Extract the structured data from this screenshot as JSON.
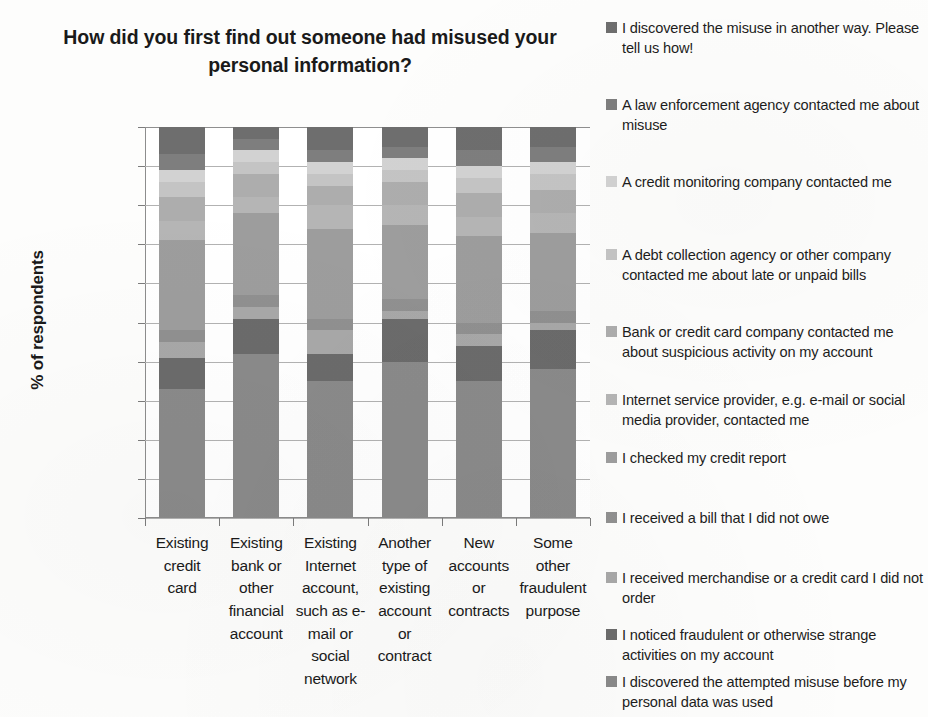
{
  "chart_data": {
    "type": "bar",
    "stacked": true,
    "title": "How did you first find out someone had misused your personal information?",
    "xlabel": "",
    "ylabel": "% of respondents",
    "ylim": [
      0,
      100
    ],
    "ytick_labels": [
      "0%",
      "10%",
      "20%",
      "30%",
      "40%",
      "50%",
      "60%",
      "70%",
      "80%",
      "90%",
      "100%"
    ],
    "ytick_values": [
      0,
      10,
      20,
      30,
      40,
      50,
      60,
      70,
      80,
      90,
      100
    ],
    "grid": true,
    "legend_position": "right",
    "categories": [
      "Existing credit card",
      "Existing bank or other financial account",
      "Existing Internet account, such as e-mail or social network",
      "Another type of existing account or contract",
      "New accounts or contracts",
      "Some other fraudulent purpose"
    ],
    "series": [
      {
        "name": "I discovered the attempted misuse before my personal data was used",
        "color": "#8a8a8a",
        "values": [
          33,
          42,
          35,
          40,
          35,
          38
        ]
      },
      {
        "name": "I noticed fraudulent or otherwise strange activities on my account",
        "color": "#6b6b6b",
        "values": [
          8,
          9,
          7,
          11,
          9,
          10
        ]
      },
      {
        "name": "I received merchandise or a credit card I did not order",
        "color": "#a8a8a8",
        "values": [
          4,
          3,
          6,
          2,
          3,
          2
        ]
      },
      {
        "name": "I received a bill that I did not owe",
        "color": "#909090",
        "values": [
          3,
          3,
          3,
          3,
          3,
          3
        ]
      },
      {
        "name": "I checked my credit report",
        "color": "#9d9d9d",
        "values": [
          23,
          21,
          23,
          19,
          22,
          20
        ]
      },
      {
        "name": "Internet service provider, e.g. e-mail or social media provider, contacted me",
        "color": "#b5b5b5",
        "values": [
          5,
          4,
          6,
          5,
          5,
          5
        ]
      },
      {
        "name": "Bank or credit card company contacted me about suspicious activity on my account",
        "color": "#adadad",
        "values": [
          6,
          6,
          5,
          6,
          6,
          6
        ]
      },
      {
        "name": "A debt collection agency or other company contacted me about late or unpaid bills",
        "color": "#c4c4c4",
        "values": [
          4,
          3,
          3,
          3,
          4,
          4
        ]
      },
      {
        "name": "A credit monitoring company contacted me",
        "color": "#d2d2d2",
        "values": [
          3,
          3,
          3,
          3,
          3,
          3
        ]
      },
      {
        "name": "A law enforcement agency contacted me about misuse",
        "color": "#7e7e7e",
        "values": [
          4,
          3,
          3,
          3,
          4,
          4
        ]
      },
      {
        "name": "I discovered the misuse in another way. Please tell us how!",
        "color": "#6e6e6e",
        "values": [
          7,
          3,
          6,
          5,
          6,
          5
        ]
      }
    ]
  },
  "chart": {
    "title": "How did you first find out someone had misused your personal information?",
    "y_axis_title": "% of respondents",
    "y_ticks": [
      "100%",
      "90%",
      "80%",
      "70%",
      "60%",
      "50%",
      "40%",
      "30%",
      "20%",
      "10%",
      "0%"
    ],
    "categories": [
      {
        "lines": [
          "Existing",
          "credit",
          "card"
        ]
      },
      {
        "lines": [
          "Existing",
          "bank or",
          "other",
          "financial",
          "account"
        ]
      },
      {
        "lines": [
          "Existing",
          "Internet",
          "account,",
          "such as e-",
          "mail or",
          "social",
          "network"
        ]
      },
      {
        "lines": [
          "Another",
          "type of",
          "existing",
          "account",
          "or",
          "contract"
        ]
      },
      {
        "lines": [
          "New",
          "accounts",
          "or",
          "contracts"
        ]
      },
      {
        "lines": [
          "Some",
          "other",
          "fraudulent",
          "purpose"
        ]
      }
    ]
  },
  "legend": {
    "items": [
      {
        "label": "I discovered the misuse in another way. Please tell us how!",
        "color": "#6e6e6e"
      },
      {
        "label": "A law enforcement agency contacted me about misuse",
        "color": "#7e7e7e"
      },
      {
        "label": "A credit monitoring company contacted me",
        "color": "#d2d2d2"
      },
      {
        "label": "A debt collection agency or other company contacted me about late or unpaid bills",
        "color": "#c4c4c4"
      },
      {
        "label": "Bank or credit card company contacted me about suspicious activity on my account",
        "color": "#adadad"
      },
      {
        "label": "Internet service provider, e.g. e-mail or social media provider, contacted me",
        "color": "#b5b5b5"
      },
      {
        "label": "I checked my credit report",
        "color": "#9d9d9d"
      },
      {
        "label": "I received a bill that I did not owe",
        "color": "#909090"
      },
      {
        "label": "I received merchandise or a credit card I did not order",
        "color": "#a8a8a8"
      },
      {
        "label": "I noticed fraudulent or otherwise strange activities on my account",
        "color": "#6b6b6b"
      },
      {
        "label": "I discovered the attempted misuse before my personal data was used",
        "color": "#8a8a8a"
      }
    ],
    "item_tops": [
      18,
      95,
      172,
      245,
      322,
      390,
      448,
      508,
      568,
      625,
      672
    ]
  }
}
